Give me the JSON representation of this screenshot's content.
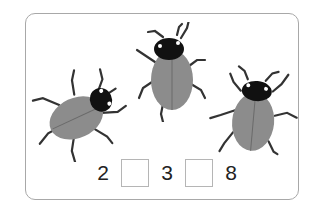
{
  "illustration": {
    "subject": "ladybug beetles",
    "count": 3,
    "beetles": [
      {
        "name": "beetle-left",
        "orientation": "head-right"
      },
      {
        "name": "beetle-center",
        "orientation": "head-up"
      },
      {
        "name": "beetle-right",
        "orientation": "head-up"
      }
    ],
    "colors": {
      "shell": "#8a8a8a",
      "head": "#111111",
      "legs": "#333333",
      "frame": "#a8a8a8"
    }
  },
  "equation": {
    "first": "2",
    "blank1": "",
    "second": "3",
    "blank2": "",
    "third": "8"
  }
}
